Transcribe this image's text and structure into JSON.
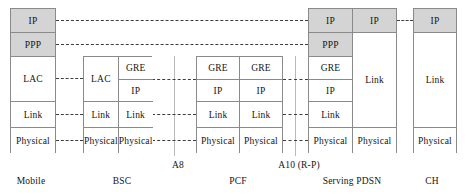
{
  "diagram": {
    "colors": {
      "shaded_cell": "#d4d4d4",
      "plain_cell": "#ffffff",
      "border": "#8a8a8a",
      "dashed_link": "#3d3d3d",
      "interface_rule": "#b9b9b9",
      "text": "#141414"
    },
    "nodes": [
      {
        "id": "mobile",
        "label": "Mobile",
        "label_x": 31,
        "x": 10,
        "y": 8,
        "w": 46,
        "h": 145,
        "columns": [
          {
            "id": "mobile-stack",
            "cells": [
              {
                "label": "IP",
                "shaded": true,
                "h": 24
              },
              {
                "label": "PPP",
                "shaded": true,
                "h": 24
              },
              {
                "label": "LAC",
                "shaded": false,
                "h": 45
              },
              {
                "label": "Link",
                "shaded": false,
                "h": 26
              },
              {
                "label": "Physical",
                "shaded": false,
                "h": 26
              }
            ]
          }
        ]
      },
      {
        "id": "bsc",
        "label": "BSC",
        "label_x": 122,
        "x": 83,
        "y": 56,
        "w": 69,
        "h": 97,
        "columns": [
          {
            "id": "bsc-left",
            "cells": [
              {
                "label": "LAC",
                "shaded": false,
                "h": 45
              },
              {
                "label": "Link",
                "shaded": false,
                "h": 26
              },
              {
                "label": "Physical",
                "shaded": false,
                "h": 26
              }
            ]
          },
          {
            "id": "bsc-right",
            "cells": [
              {
                "label": "GRE",
                "shaded": false,
                "h": 23
              },
              {
                "label": "IP",
                "shaded": false,
                "h": 22
              },
              {
                "label": "Link",
                "shaded": false,
                "h": 26
              },
              {
                "label": "Physical",
                "shaded": false,
                "h": 26
              }
            ]
          }
        ]
      },
      {
        "id": "pcf",
        "label": "PCF",
        "label_x": 238,
        "x": 196,
        "y": 56,
        "w": 87,
        "h": 97,
        "columns": [
          {
            "id": "pcf-left",
            "cells": [
              {
                "label": "GRE",
                "shaded": false,
                "h": 23
              },
              {
                "label": "IP",
                "shaded": false,
                "h": 22
              },
              {
                "label": "Link",
                "shaded": false,
                "h": 26
              },
              {
                "label": "Physical",
                "shaded": false,
                "h": 26
              }
            ]
          },
          {
            "id": "pcf-right",
            "cells": [
              {
                "label": "GRE",
                "shaded": false,
                "h": 23
              },
              {
                "label": "IP",
                "shaded": false,
                "h": 22
              },
              {
                "label": "Link",
                "shaded": false,
                "h": 26
              },
              {
                "label": "Physical",
                "shaded": false,
                "h": 26
              }
            ]
          }
        ]
      },
      {
        "id": "serving-pdsn",
        "label": "Serving PDSN",
        "label_x": 352,
        "x": 308,
        "y": 8,
        "w": 89,
        "h": 145,
        "columns": [
          {
            "id": "pdsn-left",
            "cells": [
              {
                "label": "IP",
                "shaded": true,
                "h": 24
              },
              {
                "label": "PPP",
                "shaded": true,
                "h": 24
              },
              {
                "label": "GRE",
                "shaded": false,
                "h": 23
              },
              {
                "label": "IP",
                "shaded": false,
                "h": 22
              },
              {
                "label": "Link",
                "shaded": false,
                "h": 26
              },
              {
                "label": "Physical",
                "shaded": false,
                "h": 26
              }
            ]
          },
          {
            "id": "pdsn-right",
            "cells": [
              {
                "label": "IP",
                "shaded": true,
                "h": 24
              },
              {
                "label": "Link",
                "shaded": false,
                "h": 95
              },
              {
                "label": "Physical",
                "shaded": false,
                "h": 26
              }
            ]
          }
        ]
      },
      {
        "id": "ch",
        "label": "CH",
        "label_x": 432,
        "x": 413,
        "y": 8,
        "w": 44,
        "h": 145,
        "columns": [
          {
            "id": "ch-stack",
            "cells": [
              {
                "label": "IP",
                "shaded": true,
                "h": 24
              },
              {
                "label": "Link",
                "shaded": false,
                "h": 95
              },
              {
                "label": "Physical",
                "shaded": false,
                "h": 26
              }
            ]
          }
        ]
      }
    ],
    "links": [
      {
        "id": "link-ip-mobile-pdsn",
        "layer": "IP",
        "x": 56,
        "y": 20,
        "w": 252
      },
      {
        "id": "link-ip-pdsn-ch",
        "layer": "IP",
        "x": 397,
        "y": 20,
        "w": 16
      },
      {
        "id": "link-ppp-mobile-pdsn",
        "layer": "PPP",
        "x": 56,
        "y": 44,
        "w": 252
      },
      {
        "id": "link-lac-mobile-bsc",
        "layer": "LAC",
        "x": 56,
        "y": 78,
        "w": 27
      },
      {
        "id": "link-link-mobile-bsc",
        "layer": "Link",
        "x": 56,
        "y": 114,
        "w": 27
      },
      {
        "id": "link-phy-mobile-bsc",
        "layer": "Physical",
        "x": 56,
        "y": 140,
        "w": 27
      },
      {
        "id": "link-gre-bsc-pcf",
        "layer": "GRE",
        "x": 152,
        "y": 79,
        "w": 44
      },
      {
        "id": "link-link-bsc-pcf",
        "layer": "Link",
        "x": 152,
        "y": 114,
        "w": 44
      },
      {
        "id": "link-phy-bsc-pcf",
        "layer": "Physical",
        "x": 152,
        "y": 140,
        "w": 44
      },
      {
        "id": "link-gre-pcf-pdsn",
        "layer": "GRE",
        "x": 283,
        "y": 79,
        "w": 25
      },
      {
        "id": "link-link-pcf-pdsn",
        "layer": "Link",
        "x": 283,
        "y": 114,
        "w": 25
      },
      {
        "id": "link-phy-pcf-pdsn",
        "layer": "Physical",
        "x": 283,
        "y": 140,
        "w": 25
      }
    ],
    "interfaces": [
      {
        "id": "a8",
        "label": "A8",
        "label_x": 178,
        "label_y": 160,
        "rule_x": 174,
        "rule_y": 56,
        "rule_h": 100
      },
      {
        "id": "a10",
        "label": "A10   (R-P)",
        "label_x": 299,
        "label_y": 160,
        "rule_x": 295,
        "rule_y": 56,
        "rule_h": 100
      }
    ]
  }
}
